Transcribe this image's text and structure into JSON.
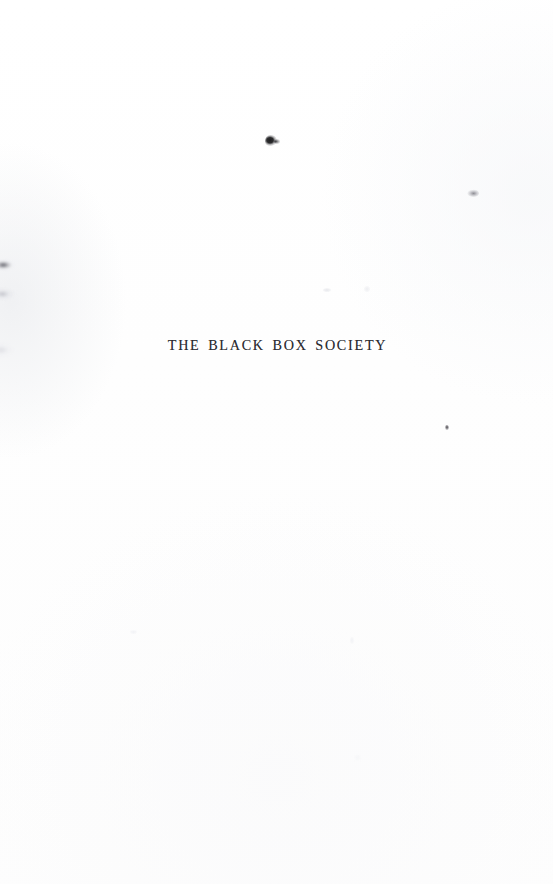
{
  "page": {
    "kind": "half-title-page",
    "background_color": "#fefefe",
    "width": 553,
    "height": 884
  },
  "title": {
    "text": "THE BLACK BOX SOCIETY",
    "color": "#2b2b30"
  },
  "artifacts": [
    {
      "name": "ink-speck-upper-center",
      "color": "#1d1d1f"
    },
    {
      "name": "ink-speck-upper-center-tail",
      "color": "#28282c"
    },
    {
      "name": "gray-speck-upper-right",
      "color": "#76767e"
    },
    {
      "name": "tiny-speck-mid-right",
      "color": "#37343a"
    },
    {
      "name": "edge-smudge-upper-left",
      "color": "#4e4e56"
    },
    {
      "name": "edge-smudge-mid-left",
      "color": "#afb0b8"
    },
    {
      "name": "edge-smudge-lower-left",
      "color": "#ced1d6"
    }
  ]
}
